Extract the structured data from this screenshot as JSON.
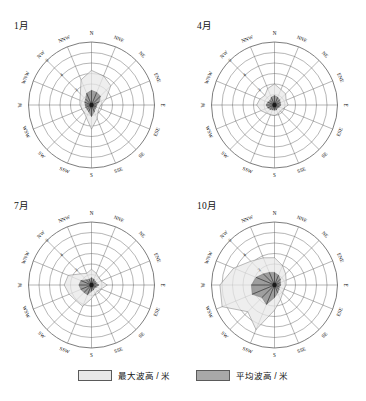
{
  "figure": {
    "panels": [
      {
        "id": "jan",
        "title": "1月"
      },
      {
        "id": "apr",
        "title": "4月"
      },
      {
        "id": "jul",
        "title": "7月"
      },
      {
        "id": "oct",
        "title": "10月"
      }
    ]
  },
  "legend": {
    "items": [
      {
        "key": "max",
        "label": "最大波高 / 米",
        "color": "#e8e8e8"
      },
      {
        "key": "mean",
        "label": "平均波高 / 米",
        "color": "#a8a8a8"
      }
    ]
  },
  "chart_data": [
    {
      "type": "area",
      "title": "1月",
      "subtype": "wave-rose",
      "directions": [
        "N",
        "NNE",
        "NE",
        "ENE",
        "E",
        "ESE",
        "SE",
        "SSE",
        "S",
        "SSW",
        "SW",
        "WSW",
        "W",
        "WNW",
        "NW",
        "NNW"
      ],
      "radial_ticks": [
        2,
        4,
        6
      ],
      "radial_tick_labels": [
        "2",
        "4",
        "6"
      ],
      "rlim": [
        0,
        6
      ],
      "grid": true,
      "series": [
        {
          "name": "最大波高 / 米",
          "color": "#e8e8e8",
          "values": [
            3.3,
            3.0,
            2.6,
            1.5,
            0.9,
            0.8,
            0.9,
            1.4,
            2.3,
            1.3,
            1.0,
            1.0,
            1.1,
            1.2,
            1.5,
            2.6
          ]
        },
        {
          "name": "平均波高 / 米",
          "color": "#8f8f8f",
          "values": [
            1.4,
            1.3,
            1.2,
            0.8,
            0.5,
            0.5,
            0.5,
            0.7,
            1.1,
            0.7,
            0.6,
            0.6,
            0.6,
            0.7,
            0.8,
            1.2
          ]
        }
      ]
    },
    {
      "type": "area",
      "title": "4月",
      "subtype": "wave-rose",
      "directions": [
        "N",
        "NNE",
        "NE",
        "ENE",
        "E",
        "ESE",
        "SE",
        "SSE",
        "S",
        "SSW",
        "SW",
        "WSW",
        "W",
        "WNW",
        "NW",
        "NNW"
      ],
      "radial_ticks": [
        2,
        4,
        6
      ],
      "radial_tick_labels": [
        "2",
        "4",
        "6"
      ],
      "rlim": [
        0,
        6
      ],
      "grid": true,
      "series": [
        {
          "name": "最大波高 / 米",
          "color": "#e8e8e8",
          "values": [
            2.0,
            1.6,
            1.5,
            1.2,
            1.3,
            0.9,
            0.8,
            0.9,
            1.0,
            1.0,
            1.1,
            1.4,
            1.7,
            1.5,
            1.3,
            1.7
          ]
        },
        {
          "name": "平均波高 / 米",
          "color": "#8f8f8f",
          "values": [
            0.9,
            0.8,
            0.7,
            0.6,
            0.6,
            0.5,
            0.4,
            0.5,
            0.5,
            0.5,
            0.6,
            0.7,
            0.8,
            0.7,
            0.6,
            0.8
          ]
        }
      ]
    },
    {
      "type": "area",
      "title": "7月",
      "subtype": "wave-rose",
      "directions": [
        "N",
        "NNE",
        "NE",
        "ENE",
        "E",
        "ESE",
        "SE",
        "SSE",
        "S",
        "SSW",
        "SW",
        "WSW",
        "W",
        "WNW",
        "NW",
        "NNW"
      ],
      "radial_ticks": [
        2,
        4,
        6
      ],
      "radial_tick_labels": [
        "2",
        "4",
        "6"
      ],
      "rlim": [
        0,
        6
      ],
      "grid": true,
      "series": [
        {
          "name": "最大波高 / 米",
          "color": "#e8e8e8",
          "values": [
            1.5,
            1.2,
            1.0,
            1.0,
            1.5,
            1.0,
            0.8,
            0.9,
            1.3,
            2.2,
            2.1,
            2.3,
            2.6,
            2.4,
            1.5,
            1.2
          ]
        },
        {
          "name": "平均波高 / 米",
          "color": "#8f8f8f",
          "values": [
            0.7,
            0.6,
            0.5,
            0.5,
            0.7,
            0.5,
            0.4,
            0.5,
            0.6,
            1.0,
            1.0,
            1.1,
            1.2,
            1.1,
            0.7,
            0.6
          ]
        }
      ]
    },
    {
      "type": "area",
      "title": "10月",
      "subtype": "wave-rose",
      "directions": [
        "N",
        "NNE",
        "NE",
        "ENE",
        "E",
        "ESE",
        "SE",
        "SSE",
        "S",
        "SSW",
        "SW",
        "WSW",
        "W",
        "WNW",
        "NW",
        "NNW"
      ],
      "radial_ticks": [
        2,
        4,
        6
      ],
      "radial_tick_labels": [
        "2",
        "4",
        "6"
      ],
      "rlim": [
        0,
        6
      ],
      "grid": true,
      "series": [
        {
          "name": "最大波高 / 米",
          "color": "#e8e8e8",
          "values": [
            2.6,
            2.0,
            1.5,
            1.2,
            1.1,
            1.0,
            1.1,
            1.5,
            2.4,
            4.6,
            3.6,
            5.4,
            5.2,
            4.2,
            3.2,
            2.8
          ]
        },
        {
          "name": "平均波高 / 米",
          "color": "#8f8f8f",
          "values": [
            1.2,
            1.0,
            0.8,
            0.6,
            0.6,
            0.5,
            0.6,
            0.8,
            1.2,
            2.0,
            1.7,
            2.3,
            2.2,
            1.9,
            1.5,
            1.3
          ]
        }
      ]
    }
  ]
}
